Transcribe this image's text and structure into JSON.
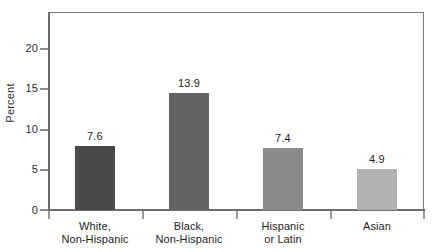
{
  "chart_data": {
    "type": "bar",
    "title": "",
    "subtitle": "",
    "xlabel": "",
    "ylabel": "Percent",
    "categories": [
      "White, Non-Hispanic",
      "Black, Non-Hispanic",
      "Hispanic or Latin",
      "Asian"
    ],
    "category_lines": [
      [
        "White,",
        "Non-Hispanic"
      ],
      [
        "Black,",
        "Non-Hispanic"
      ],
      [
        "Hispanic",
        "or Latin"
      ],
      [
        "Asian"
      ]
    ],
    "values": [
      7.6,
      13.9,
      7.4,
      4.9
    ],
    "value_labels": [
      "7.6",
      "13.9",
      "7.4",
      "4.9"
    ],
    "ylim": [
      0,
      23.5
    ],
    "yticks": [
      0,
      5,
      10,
      15,
      20
    ],
    "ytick_labels": [
      "0",
      "5",
      "10",
      "15",
      "20"
    ],
    "grid": false,
    "legend": false,
    "bar_colors": [
      "#4a4a4a",
      "#636363",
      "#8b8b8b",
      "#b2b2b2"
    ],
    "axis_color": "#6e6e6e",
    "frame_color": "#8d8d8d",
    "text_color": "#1e1e1e"
  }
}
